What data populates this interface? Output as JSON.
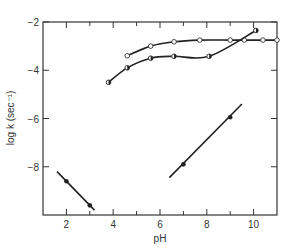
{
  "chart_data": {
    "type": "line",
    "title": "",
    "xlabel": "pH",
    "ylabel": "log k (sec⁻¹)",
    "xlim": [
      1,
      11
    ],
    "ylim": [
      -10,
      -2
    ],
    "grid": false,
    "legend": null,
    "x_ticks": [
      2,
      4,
      6,
      8,
      10
    ],
    "x_minor_ticks": [
      3,
      5,
      7,
      9
    ],
    "y_ticks": [
      -2,
      -4,
      -6,
      -8
    ],
    "y_tick_labels": [
      "−2",
      "−4",
      "−6",
      "−8"
    ],
    "x_tick_labels": [
      "2",
      "4",
      "6",
      "8",
      "10"
    ],
    "series": [
      {
        "name": "open-circles",
        "marker": "open-circle",
        "points": [
          [
            4.6,
            -3.4
          ],
          [
            5.6,
            -3.0
          ],
          [
            6.6,
            -2.82
          ],
          [
            7.7,
            -2.75
          ],
          [
            9.0,
            -2.75
          ],
          [
            9.6,
            -2.75
          ],
          [
            10.4,
            -2.75
          ],
          [
            11.0,
            -2.75
          ]
        ]
      },
      {
        "name": "half-filled-circles",
        "marker": "half-circle",
        "points": [
          [
            3.8,
            -4.5
          ],
          [
            4.6,
            -3.9
          ],
          [
            5.6,
            -3.5
          ],
          [
            6.6,
            -3.42
          ],
          [
            8.1,
            -3.42
          ],
          [
            10.1,
            -2.35
          ]
        ]
      },
      {
        "name": "low-pH-line",
        "marker": "filled-circle",
        "points": [
          [
            2.0,
            -8.6
          ],
          [
            3.0,
            -9.6
          ]
        ],
        "line": [
          [
            1.6,
            -8.2
          ],
          [
            3.2,
            -9.8
          ]
        ]
      },
      {
        "name": "high-pH-line",
        "marker": "filled-circle",
        "points": [
          [
            7.0,
            -7.9
          ],
          [
            9.0,
            -5.95
          ]
        ],
        "line": [
          [
            6.4,
            -8.45
          ],
          [
            9.5,
            -5.4
          ]
        ]
      }
    ]
  }
}
